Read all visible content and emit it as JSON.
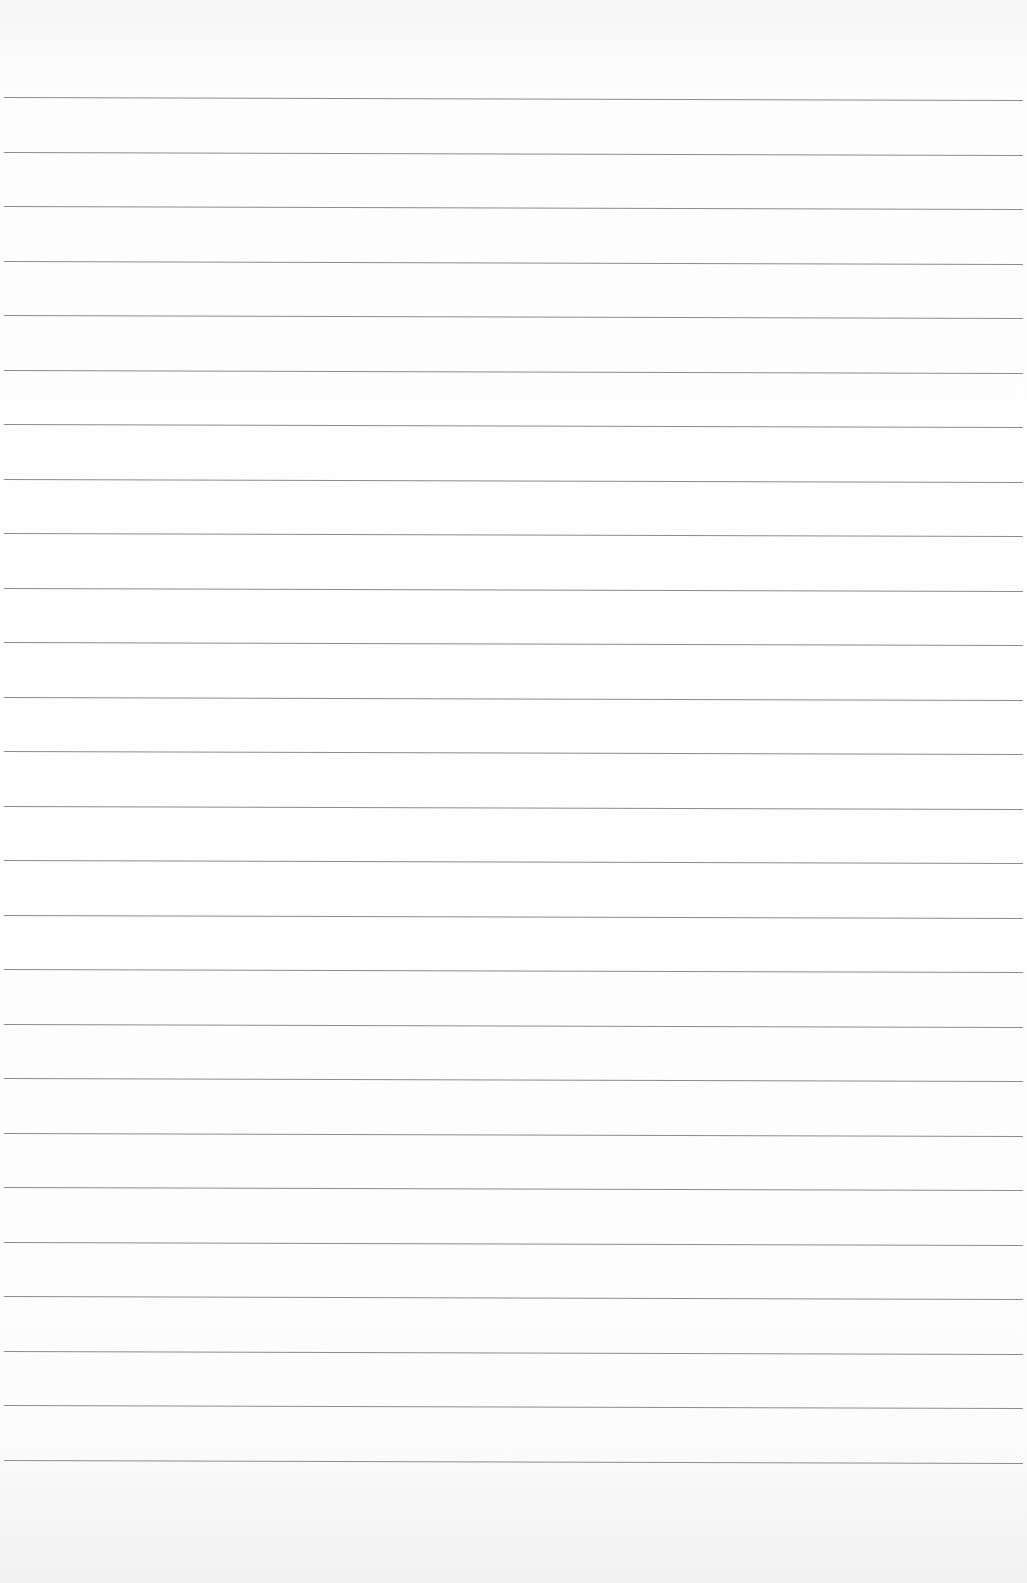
{
  "page": {
    "type": "blank lined paper",
    "line_count": 26,
    "first_line_y": 97,
    "line_spacing": 54.5,
    "line_color": "#8c8c8c",
    "paper_color": "#fbfbfb"
  }
}
